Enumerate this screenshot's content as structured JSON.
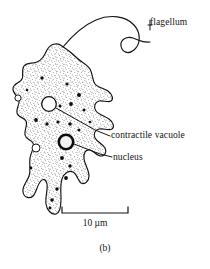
{
  "figure": {
    "caption": "(b)",
    "organism_outline_color": "#111111",
    "background_color": "#ffffff",
    "stipple_color": "#2a2a2a"
  },
  "labels": {
    "flagellum": "flagellum",
    "contractile_vacuole": "contractile vacuole",
    "nucleus": "nucleus"
  },
  "scalebar": {
    "label": "10 µm",
    "value": 10,
    "unit": "µm",
    "bar_length_px": 66
  }
}
